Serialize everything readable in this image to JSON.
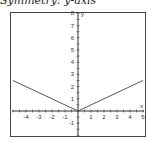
{
  "caption": "Symmetry: y-axis",
  "chart_data": {
    "type": "line",
    "title": "Symmetry: y-axis",
    "xlabel": "x",
    "ylabel": "y",
    "xlim": [
      -5,
      5
    ],
    "ylim": [
      -2,
      8
    ],
    "x_ticks": [
      -4,
      -3,
      -2,
      -1,
      1,
      2,
      3,
      4,
      5
    ],
    "y_ticks": [
      -1,
      1,
      2,
      3,
      4,
      5,
      6,
      7,
      8
    ],
    "grid": false,
    "series": [
      {
        "name": "y = 0.5|x|",
        "x": [
          -5,
          0,
          5
        ],
        "y": [
          2.5,
          0,
          2.5
        ],
        "color": "#555555"
      }
    ]
  }
}
